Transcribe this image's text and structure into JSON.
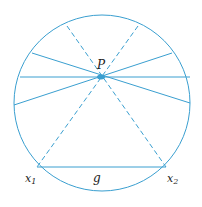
{
  "labels": {
    "p": "P",
    "x1": "x",
    "x1_sub": "1",
    "x2": "x",
    "x2_sub": "2",
    "g": "g"
  },
  "colors": {
    "line": "#3a9fd0",
    "text": "#222222"
  }
}
